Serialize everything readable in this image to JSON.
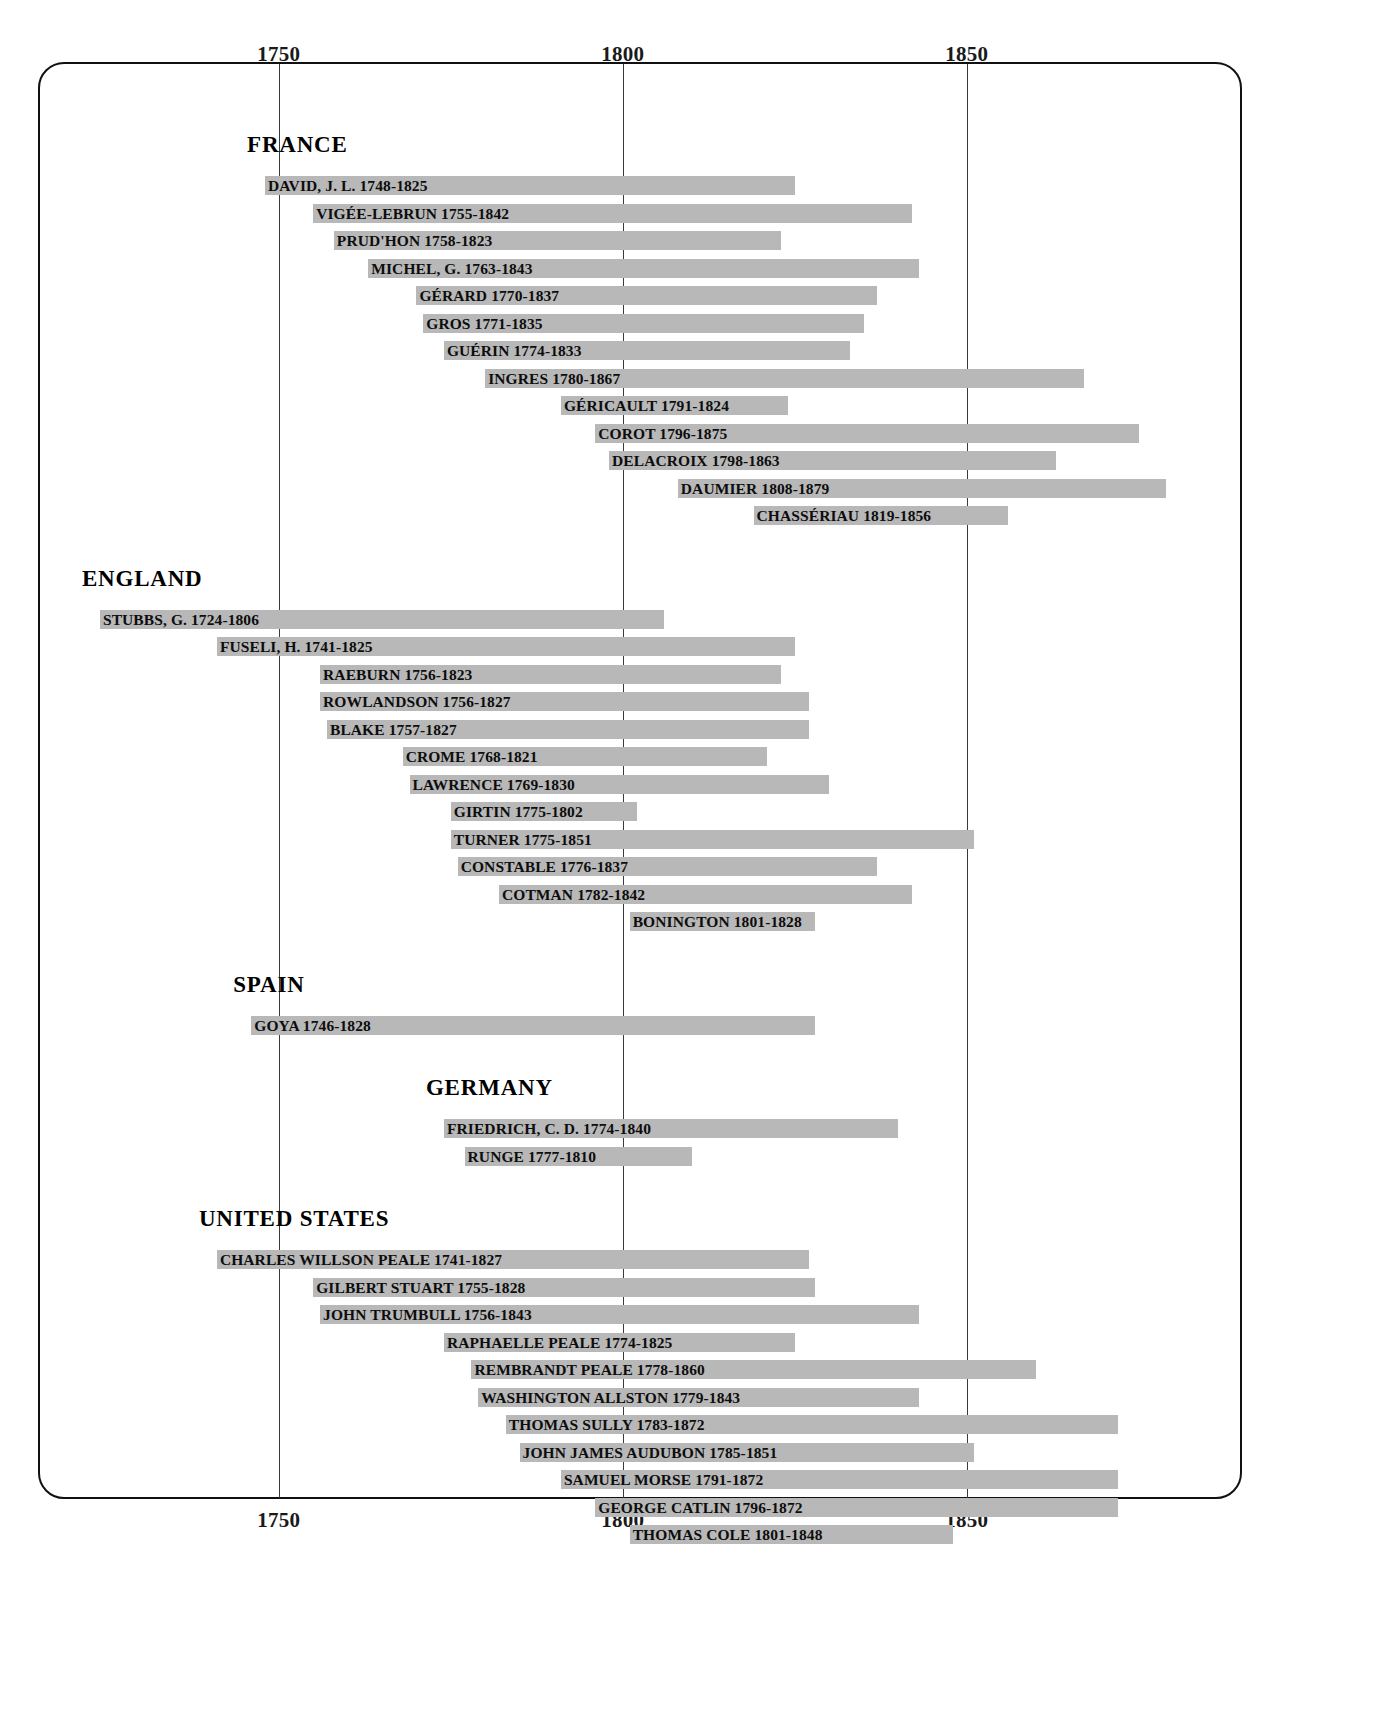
{
  "chart_data": {
    "type": "bar",
    "title": "",
    "subtitle": "",
    "xlabel": "",
    "ylabel": "",
    "orientation": "horizontal",
    "bar_kind": "span/gantt lifespan bars",
    "grid": "vertical gridlines at 1750, 1800, 1850",
    "legend": "none",
    "axis_ticks_top": [
      "1750",
      "1800",
      "1850"
    ],
    "axis_ticks_bottom": [
      "1750",
      "1800",
      "1850"
    ],
    "tick_values": [
      1750,
      1800,
      1850
    ],
    "xlim": [
      1715,
      1890
    ],
    "bar_color": "#b8b8b8",
    "groups": [
      {
        "name": "FRANCE",
        "artists": [
          {
            "label": "DAVID, J. L. 1748-1825",
            "name": "DAVID, J. L.",
            "start": 1748,
            "end": 1825
          },
          {
            "label": "VIGÉE-LEBRUN 1755-1842",
            "name": "VIGÉE-LEBRUN",
            "start": 1755,
            "end": 1842
          },
          {
            "label": "PRUD'HON 1758-1823",
            "name": "PRUD'HON",
            "start": 1758,
            "end": 1823
          },
          {
            "label": "MICHEL, G. 1763-1843",
            "name": "MICHEL, G.",
            "start": 1763,
            "end": 1843
          },
          {
            "label": "GÉRARD 1770-1837",
            "name": "GÉRARD",
            "start": 1770,
            "end": 1837
          },
          {
            "label": "GROS 1771-1835",
            "name": "GROS",
            "start": 1771,
            "end": 1835
          },
          {
            "label": "GUÉRIN 1774-1833",
            "name": "GUÉRIN",
            "start": 1774,
            "end": 1833
          },
          {
            "label": "INGRES 1780-1867",
            "name": "INGRES",
            "start": 1780,
            "end": 1867
          },
          {
            "label": "GÉRICAULT 1791-1824",
            "name": "GÉRICAULT",
            "start": 1791,
            "end": 1824
          },
          {
            "label": "COROT 1796-1875",
            "name": "COROT",
            "start": 1796,
            "end": 1875
          },
          {
            "label": "DELACROIX 1798-1863",
            "name": "DELACROIX",
            "start": 1798,
            "end": 1863
          },
          {
            "label": "DAUMIER 1808-1879",
            "name": "DAUMIER",
            "start": 1808,
            "end": 1879
          },
          {
            "label": "CHASSÉRIAU 1819-1856",
            "name": "CHASSÉRIAU",
            "start": 1819,
            "end": 1856
          }
        ]
      },
      {
        "name": "ENGLAND",
        "artists": [
          {
            "label": "STUBBS, G. 1724-1806",
            "name": "STUBBS, G.",
            "start": 1724,
            "end": 1806
          },
          {
            "label": "FUSELI, H. 1741-1825",
            "name": "FUSELI, H.",
            "start": 1741,
            "end": 1825
          },
          {
            "label": "RAEBURN 1756-1823",
            "name": "RAEBURN",
            "start": 1756,
            "end": 1823
          },
          {
            "label": "ROWLANDSON 1756-1827",
            "name": "ROWLANDSON",
            "start": 1756,
            "end": 1827
          },
          {
            "label": "BLAKE 1757-1827",
            "name": "BLAKE",
            "start": 1757,
            "end": 1827
          },
          {
            "label": "CROME 1768-1821",
            "name": "CROME",
            "start": 1768,
            "end": 1821
          },
          {
            "label": "LAWRENCE 1769-1830",
            "name": "LAWRENCE",
            "start": 1769,
            "end": 1830
          },
          {
            "label": "GIRTIN 1775-1802",
            "name": "GIRTIN",
            "start": 1775,
            "end": 1802
          },
          {
            "label": "TURNER 1775-1851",
            "name": "TURNER",
            "start": 1775,
            "end": 1851
          },
          {
            "label": "CONSTABLE 1776-1837",
            "name": "CONSTABLE",
            "start": 1776,
            "end": 1837
          },
          {
            "label": "COTMAN 1782-1842",
            "name": "COTMAN",
            "start": 1782,
            "end": 1842
          },
          {
            "label": "BONINGTON 1801-1828",
            "name": "BONINGTON",
            "start": 1801,
            "end": 1828
          }
        ]
      },
      {
        "name": "SPAIN",
        "artists": [
          {
            "label": "GOYA 1746-1828",
            "name": "GOYA",
            "start": 1746,
            "end": 1828
          }
        ]
      },
      {
        "name": "GERMANY",
        "artists": [
          {
            "label": "FRIEDRICH, C. D. 1774-1840",
            "name": "FRIEDRICH, C. D.",
            "start": 1774,
            "end": 1840
          },
          {
            "label": "RUNGE 1777-1810",
            "name": "RUNGE",
            "start": 1777,
            "end": 1810
          }
        ]
      },
      {
        "name": "UNITED STATES",
        "artists": [
          {
            "label": "CHARLES WILLSON PEALE 1741-1827",
            "name": "CHARLES WILLSON PEALE",
            "start": 1741,
            "end": 1827
          },
          {
            "label": "GILBERT STUART 1755-1828",
            "name": "GILBERT STUART",
            "start": 1755,
            "end": 1828
          },
          {
            "label": "JOHN TRUMBULL 1756-1843",
            "name": "JOHN TRUMBULL",
            "start": 1756,
            "end": 1843
          },
          {
            "label": "RAPHAELLE PEALE 1774-1825",
            "name": "RAPHAELLE PEALE",
            "start": 1774,
            "end": 1825
          },
          {
            "label": "REMBRANDT PEALE 1778-1860",
            "name": "REMBRANDT PEALE",
            "start": 1778,
            "end": 1860
          },
          {
            "label": "WASHINGTON ALLSTON 1779-1843",
            "name": "WASHINGTON ALLSTON",
            "start": 1779,
            "end": 1843
          },
          {
            "label": "THOMAS SULLY 1783-1872",
            "name": "THOMAS SULLY",
            "start": 1783,
            "end": 1872
          },
          {
            "label": "JOHN JAMES AUDUBON 1785-1851",
            "name": "JOHN JAMES AUDUBON",
            "start": 1785,
            "end": 1851
          },
          {
            "label": "SAMUEL MORSE 1791-1872",
            "name": "SAMUEL MORSE",
            "start": 1791,
            "end": 1872
          },
          {
            "label": "GEORGE CATLIN 1796-1872",
            "name": "GEORGE CATLIN",
            "start": 1796,
            "end": 1872
          },
          {
            "label": "THOMAS COLE 1801-1848",
            "name": "THOMAS COLE",
            "start": 1801,
            "end": 1848
          }
        ]
      }
    ]
  }
}
